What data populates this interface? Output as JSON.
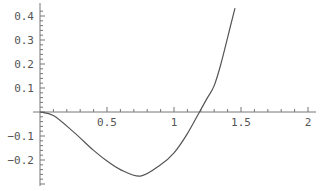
{
  "chart_data": {
    "type": "line",
    "title": "",
    "xlabel": "",
    "ylabel": "",
    "xlim": [
      0,
      2
    ],
    "ylim": [
      -0.27,
      0.43
    ],
    "grid": false,
    "legend": null,
    "x_ticks": [
      {
        "value": 0.5,
        "label": "0.5"
      },
      {
        "value": 1,
        "label": "1"
      },
      {
        "value": 1.5,
        "label": "1.5"
      },
      {
        "value": 2,
        "label": "2"
      }
    ],
    "y_ticks": [
      {
        "value": 0.4,
        "label": "0.4"
      },
      {
        "value": 0.3,
        "label": "0.3"
      },
      {
        "value": 0.2,
        "label": "0.2"
      },
      {
        "value": 0.1,
        "label": "0.1"
      },
      {
        "value": -0.1,
        "label": "-0.1"
      },
      {
        "value": -0.2,
        "label": "-0.2"
      }
    ],
    "series": [
      {
        "name": "f(x)",
        "color": "#555555",
        "x": [
          0,
          0.1,
          0.25,
          0.4,
          0.5,
          0.6,
          0.75,
          0.9,
          1.0,
          1.1,
          1.19,
          1.25,
          1.3,
          1.35,
          1.4,
          1.455
        ],
        "y": [
          0,
          -0.015,
          -0.083,
          -0.16,
          -0.204,
          -0.24,
          -0.267,
          -0.22,
          -0.17,
          -0.09,
          0,
          0.06,
          0.11,
          0.2,
          0.31,
          0.433
        ]
      }
    ]
  }
}
